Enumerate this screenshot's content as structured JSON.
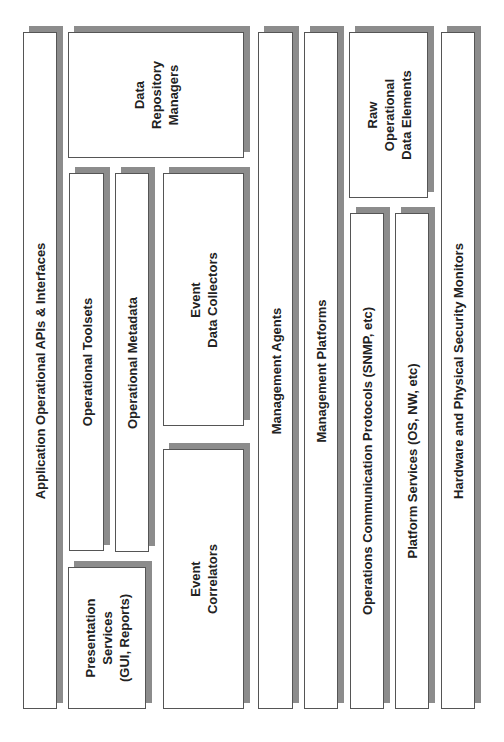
{
  "diagram": {
    "orientation": "rotated -90deg (text reads bottom-to-top)",
    "shadow_color": "#8c8c8c",
    "border_color": "#555555",
    "boxes": {
      "app_apis": {
        "label": "Application Operational APIs & Interfaces"
      },
      "data_repo": {
        "label": "Data\nRepository\nManagers"
      },
      "toolsets": {
        "label": "Operational Toolsets"
      },
      "metadata": {
        "label": "Operational Metadata"
      },
      "presentation": {
        "label": "Presentation\nServices\n(GUI, Reports)"
      },
      "event_collectors": {
        "label": "Event\nData Collectors"
      },
      "event_correlators": {
        "label": "Event\nCorrelators"
      },
      "mgmt_agents": {
        "label": "Management Agents"
      },
      "mgmt_platforms": {
        "label": "Management Platforms"
      },
      "raw_data": {
        "label": "Raw\nOperational\nData Elements"
      },
      "comm_protocols": {
        "label": "Operations Communication Protocols (SNMP, etc)"
      },
      "platform_services": {
        "label": "Platform Services (OS, NW, etc)"
      },
      "hardware_monitors": {
        "label": "Hardware and Physical Security Monitors"
      }
    }
  }
}
